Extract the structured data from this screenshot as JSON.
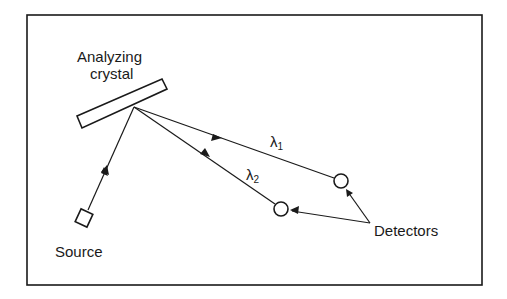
{
  "diagram": {
    "labels": {
      "crystal_line1": "Analyzing",
      "crystal_line2": "crystal",
      "source": "Source",
      "detectors": "Detectors",
      "lambda1": "λ",
      "lambda1_sub": "1",
      "lambda2": "λ",
      "lambda2_sub": "2"
    },
    "colors": {
      "ink": "#1a1a1a",
      "background": "#ffffff"
    },
    "components": [
      {
        "id": "source",
        "shape": "square",
        "label": "Source"
      },
      {
        "id": "analyzing-crystal",
        "shape": "rectangle",
        "label": "Analyzing crystal"
      },
      {
        "id": "detector-1",
        "shape": "circle",
        "wavelength": "λ1"
      },
      {
        "id": "detector-2",
        "shape": "circle",
        "wavelength": "λ2"
      }
    ],
    "connections": [
      {
        "from": "source",
        "to": "analyzing-crystal"
      },
      {
        "from": "analyzing-crystal",
        "to": "detector-1",
        "label": "λ1"
      },
      {
        "from": "analyzing-crystal",
        "to": "detector-2",
        "label": "λ2"
      },
      {
        "from": "detectors-label",
        "to": "detector-1"
      },
      {
        "from": "detectors-label",
        "to": "detector-2"
      }
    ]
  }
}
